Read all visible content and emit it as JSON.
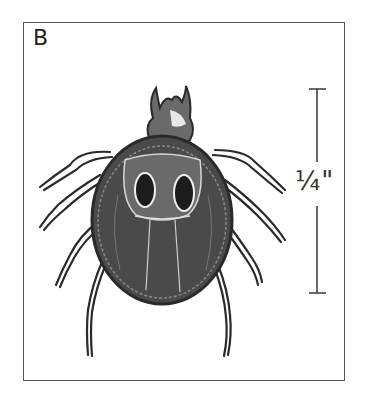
{
  "figure": {
    "panel_label": "B",
    "scale_label": "1/4\"",
    "scale_display": "¼\"",
    "colors": {
      "frame": "#555555",
      "ink": "#2a2a2a",
      "body_fill": "#4a4a4a",
      "highlight": "#dddddd"
    }
  }
}
